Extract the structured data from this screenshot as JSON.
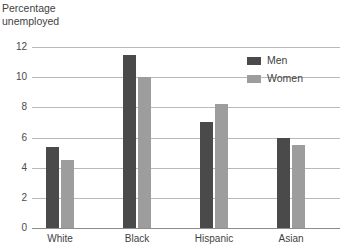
{
  "chart_data": {
    "type": "bar",
    "title": "Percentage\nunemployed",
    "xlabel": "",
    "ylabel": "Percentage unemployed",
    "categories": [
      "White",
      "Black",
      "Hispanic",
      "Asian"
    ],
    "series": [
      {
        "name": "Men",
        "values": [
          5.4,
          11.5,
          7.0,
          6.0
        ],
        "color": "#4a4a4a"
      },
      {
        "name": "Women",
        "values": [
          4.5,
          10.0,
          8.2,
          5.5
        ],
        "color": "#9d9d9d"
      }
    ],
    "ylim": [
      0,
      12
    ],
    "ytick_labels": [
      "12",
      "10",
      "8",
      "6",
      "4",
      "2",
      "0"
    ],
    "ytick_values": [
      12,
      10,
      8,
      6,
      4,
      2,
      0
    ],
    "grid": true,
    "legend_position": "top-right",
    "legend": [
      {
        "label": "Men",
        "color": "#4a4a4a"
      },
      {
        "label": "Women",
        "color": "#9d9d9d"
      }
    ]
  }
}
